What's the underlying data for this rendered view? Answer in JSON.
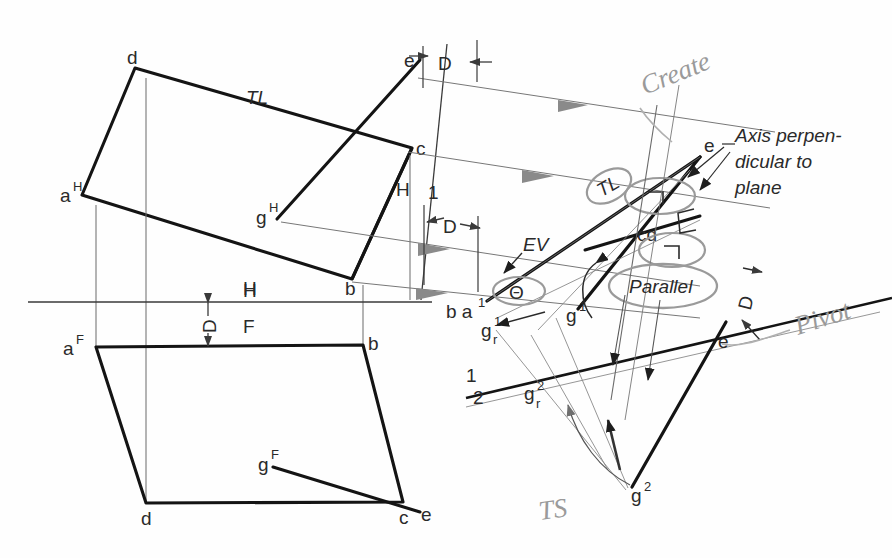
{
  "sheet": {
    "title": "Descriptive geometry construction - true size of oblique plane by rotation",
    "background": "#fefefe",
    "ink_color": "#1a1a1a",
    "thin_color": "#555555",
    "pencil_color": "#9a9a9a",
    "gray_annotation_color": "#8c8c8c"
  },
  "labels": {
    "top_view": {
      "a": "a",
      "a_sup": "H",
      "b": "b",
      "c": "c",
      "d": "d",
      "e": "e",
      "g": "g",
      "g_sup": "H",
      "tl": "TL",
      "fold_h": "H"
    },
    "front_view": {
      "a": "a",
      "a_sup": "F",
      "b": "b",
      "c": "c",
      "d": "d",
      "e": "e",
      "g": "g",
      "g_sup": "F",
      "fold_h": "H",
      "fold_f": "F",
      "depth": "D"
    },
    "aux_view_1": {
      "fold_h": "H",
      "fold_1": "1",
      "depth_top": "D",
      "depth_bottom": "D",
      "ev": "EV",
      "theta": "Θ",
      "b_a1": "b a",
      "b_a1_sup": "1",
      "e": "e",
      "cd": "cd",
      "tl": "TL",
      "g1": "g",
      "g1_sup": "1",
      "gr1": "g",
      "gr1_sub": "r",
      "gr1_sup": "1"
    },
    "aux_view_2": {
      "fold_1": "1",
      "fold_2": "2",
      "depth": "D",
      "e": "e",
      "g2": "g",
      "g2_sup": "2",
      "gr2": "g",
      "gr2_sub": "r",
      "gr2_sup": "2",
      "parallel": "Parallel"
    },
    "annotations": {
      "axis_note_line1": "Axis perpen-",
      "axis_note_line2": "dicular to",
      "axis_note_line3": "plane",
      "create": "Create",
      "pivot": "Pivot",
      "ts": "TS"
    }
  },
  "geometry": {
    "top_view_quad": "a(82,195) d(135,68) c(412,148) b(352,279)",
    "front_view_quad": "a(96,347) b(363,345) c(403,502) d(146,503)",
    "hf_line_y": 302,
    "note": "orthographic top and front views of plane ABCD with point G, plus two successive auxiliary views"
  }
}
